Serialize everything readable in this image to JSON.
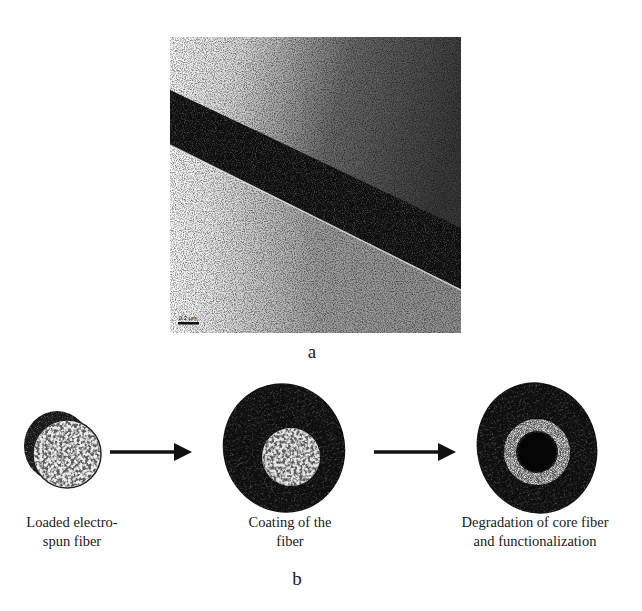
{
  "figure": {
    "panel_a": {
      "label": "a",
      "image_description": "TEM micrograph of a single electrospun core-shell fiber crossing diagonally",
      "scale_bar": "0.2 μm"
    },
    "panel_b": {
      "label": "b",
      "steps": [
        {
          "caption_line1": "Loaded electro-",
          "caption_line2": "spun fiber"
        },
        {
          "caption_line1": "Coating of the",
          "caption_line2": "fiber"
        },
        {
          "caption_line1": "Degradation of core fiber",
          "caption_line2": "and functionalization"
        }
      ],
      "arrows": [
        "arrow-right",
        "arrow-right"
      ]
    }
  }
}
